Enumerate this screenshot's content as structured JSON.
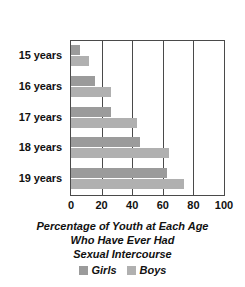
{
  "chart_data": {
    "type": "bar",
    "orientation": "horizontal",
    "title_lines": [
      "Percentage of Youth at Each Age",
      "Who Have Ever Had",
      "Sexual Intercourse"
    ],
    "xlabel": "",
    "ylabel": "",
    "categories": [
      "15 years",
      "16 years",
      "17 years",
      "18 years",
      "19 years"
    ],
    "series": [
      {
        "name": "Girls",
        "color": "#9b9b9b",
        "values": [
          6,
          16,
          26,
          45,
          63
        ]
      },
      {
        "name": "Boys",
        "color": "#b0b0b0",
        "values": [
          12,
          26,
          43,
          64,
          74
        ]
      }
    ],
    "xlim": [
      0,
      100
    ],
    "xticks": [
      0,
      20,
      40,
      60,
      80,
      100
    ],
    "xtick_labels": [
      "0",
      "20",
      "40",
      "60",
      "80",
      "100"
    ],
    "grid": "vertical",
    "legend_position": "bottom",
    "legend": [
      {
        "label": "Girls",
        "color": "#9b9b9b"
      },
      {
        "label": "Boys",
        "color": "#b0b0b0"
      }
    ]
  }
}
